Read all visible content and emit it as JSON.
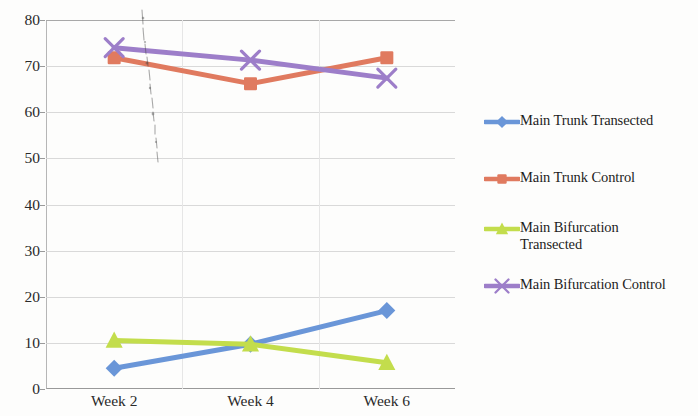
{
  "chart_data": {
    "type": "line",
    "title": "",
    "xlabel": "",
    "ylabel": "",
    "categories": [
      "Week 2",
      "Week 4",
      "Week 6"
    ],
    "ylim": [
      0,
      80
    ],
    "y_ticks": [
      0,
      10,
      20,
      30,
      40,
      50,
      60,
      70,
      80
    ],
    "grid": true,
    "legend_position": "right",
    "series": [
      {
        "name": "Main Trunk Transected",
        "color": "#6a96d8",
        "marker": "diamond",
        "values": [
          4.5,
          9.7,
          17.0
        ]
      },
      {
        "name": "Main Trunk Control",
        "color": "#e07a5f",
        "marker": "square",
        "values": [
          71.8,
          66.2,
          71.8
        ]
      },
      {
        "name": "Main Bifurcation\nTransected",
        "color": "#c3dd4c",
        "marker": "triangle",
        "values": [
          10.5,
          9.7,
          5.7
        ]
      },
      {
        "name": "Main Bifurcation Control",
        "color": "#9d7ec9",
        "marker": "x",
        "values": [
          74.0,
          71.3,
          67.4
        ]
      }
    ]
  },
  "axis": {
    "y_tick_labels": [
      "0",
      "10",
      "20",
      "30",
      "40",
      "50",
      "60",
      "70",
      "80"
    ],
    "x_tick_labels": [
      "Week 2",
      "Week 4",
      "Week 6"
    ]
  },
  "legend": {
    "entries": [
      {
        "label": "Main Trunk Transected",
        "color": "#6a96d8",
        "marker": "diamond"
      },
      {
        "label": "Main Trunk Control",
        "color": "#e07a5f",
        "marker": "square"
      },
      {
        "label": "Main Bifurcation\nTransected",
        "color": "#c3dd4c",
        "marker": "triangle"
      },
      {
        "label": "Main Bifurcation Control",
        "color": "#9d7ec9",
        "marker": "x"
      }
    ]
  },
  "colors": {
    "main_trunk_transected": "#6a96d8",
    "main_trunk_control": "#e07a5f",
    "main_bifurcation_transected": "#c3dd4c",
    "main_bifurcation_control": "#9d7ec9",
    "gridline": "#d9d9d9",
    "axis": "#999999",
    "text": "#2a2a2a",
    "background": "#fdfdfc"
  }
}
